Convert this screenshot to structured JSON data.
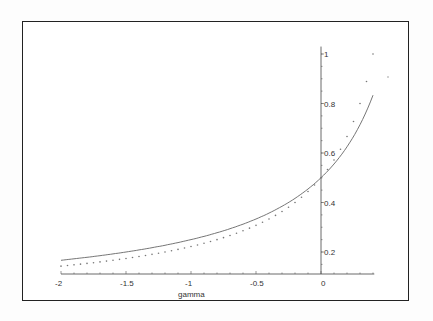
{
  "chart_data": {
    "type": "line",
    "title": "",
    "xlabel": "gamma",
    "ylabel": "",
    "xlim": [
      -2,
      0.4
    ],
    "ylim": [
      0.1,
      1.02
    ],
    "x_ticks": [
      -2,
      -1.5,
      -1,
      -0.5,
      0
    ],
    "x_tick_labels": [
      "-2",
      "-1.5",
      "-1",
      "-0.5",
      "0"
    ],
    "y_ticks": [
      0.2,
      0.4,
      0.6,
      0.8,
      1
    ],
    "y_tick_labels": [
      "0.2",
      "0.4",
      "0.6",
      "0.8",
      "1"
    ],
    "grid": false,
    "legend": null,
    "series": [
      {
        "name": "solid curve",
        "style": "solid",
        "x": [
          -2,
          -1.5,
          -1,
          -0.5,
          0,
          0.2,
          0.4
        ],
        "values": [
          0.167,
          0.2,
          0.25,
          0.333,
          0.5,
          0.625,
          0.833
        ]
      },
      {
        "name": "dotted curve",
        "style": "dotted",
        "x": [
          -2,
          -1.5,
          -1,
          -0.5,
          0,
          0.2,
          0.4
        ],
        "values": [
          0.143,
          0.174,
          0.222,
          0.308,
          0.5,
          0.667,
          1.0
        ]
      }
    ]
  },
  "axes": {
    "xlabel": "gamma",
    "x_tick_labels": [
      "-2",
      "-1.5",
      "-1",
      "-0.5",
      "0"
    ],
    "y_tick_labels": [
      "0.2",
      "0.4",
      "0.6",
      "0.8",
      "1"
    ]
  }
}
